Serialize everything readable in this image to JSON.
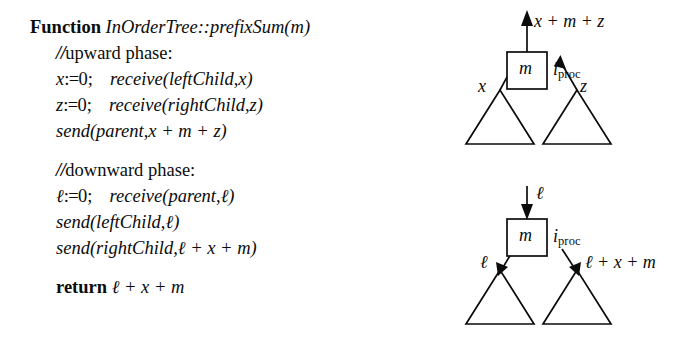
{
  "figure": {
    "ink_color": "#0c0c0c",
    "background_color": "#ffffff"
  },
  "pseudocode": {
    "header": {
      "keyword": "Function",
      "name": "InOrderTree::prefixSum",
      "open_paren": "(",
      "param": "m",
      "close_paren": ")"
    },
    "upward_comment": {
      "slashes": "//",
      "text": "upward phase:"
    },
    "line_x_init": {
      "var": "x",
      "assign": ":=",
      "value": "0",
      "semicolon": ";",
      "call": "receive",
      "open_paren": "(",
      "arg1": "leftChild",
      "comma": ",",
      "arg2": "x",
      "close_paren": ")"
    },
    "line_z_init": {
      "var": "z",
      "assign": ":=",
      "value": "0",
      "semicolon": ";",
      "call": "receive",
      "open_paren": "(",
      "arg1": "rightChild",
      "comma": ",",
      "arg2": "z",
      "close_paren": ")"
    },
    "line_send_parent": {
      "call": "send",
      "open_paren": "(",
      "arg1": "parent",
      "comma": ",",
      "expr": "x + m + z",
      "close_paren": ")"
    },
    "downward_comment": {
      "slashes": "//",
      "text": "downward phase:"
    },
    "line_l_init": {
      "var": "ℓ",
      "assign": ":=",
      "value": "0",
      "semicolon": ";",
      "call": "receive",
      "open_paren": "(",
      "arg1": "parent",
      "comma": ",",
      "arg2": "ℓ",
      "close_paren": ")"
    },
    "line_send_left": {
      "call": "send",
      "open_paren": "(",
      "arg1": "leftChild",
      "comma": ",",
      "arg2": "ℓ",
      "close_paren": ")"
    },
    "line_send_right": {
      "call": "send",
      "open_paren": "(",
      "arg1": "rightChild",
      "comma": ",",
      "expr": "ℓ + x + m",
      "close_paren": ")"
    },
    "line_return": {
      "keyword": "return",
      "expr": "ℓ + x + m"
    }
  },
  "diagrams": {
    "upward": {
      "node_value": "m",
      "node_label_i": "i",
      "node_label_sub": "proc",
      "top_arrow_label": "x + m + z",
      "left_arrow_label": "x",
      "right_arrow_label": "z",
      "left_subtree": "triangle",
      "right_subtree": "triangle",
      "arrow_direction": "up"
    },
    "downward": {
      "node_value": "m",
      "node_label_i": "i",
      "node_label_sub": "proc",
      "top_arrow_label": "ℓ",
      "left_arrow_label": "ℓ",
      "right_arrow_label": "ℓ + x + m",
      "left_subtree": "triangle",
      "right_subtree": "triangle",
      "arrow_direction": "down"
    }
  }
}
